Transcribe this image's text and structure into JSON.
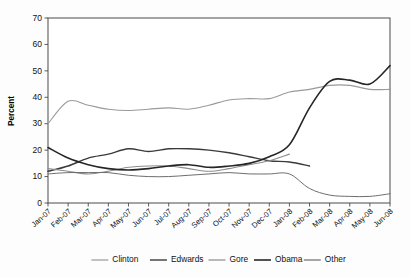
{
  "chart_data": {
    "type": "line",
    "title": "",
    "xlabel": "",
    "ylabel": "Percent",
    "ylim": [
      0,
      70
    ],
    "yticks": [
      0,
      10,
      20,
      30,
      40,
      50,
      60,
      70
    ],
    "grid": false,
    "legend_position": "bottom",
    "x": [
      "Jan-07",
      "Feb-07",
      "Mar-07",
      "Apr-07",
      "May-07",
      "Jun-07",
      "Jul-07",
      "Aug-07",
      "Sep-07",
      "Oct-07",
      "Nov-07",
      "Dec-07",
      "Jan-08",
      "Feb-08",
      "Mar-08",
      "Apr-08",
      "May-08",
      "Jun-08"
    ],
    "series": [
      {
        "name": "Clinton",
        "color": "#9a9a9a",
        "width": 1.1,
        "dash": "none",
        "values": [
          30,
          38.5,
          37,
          35.5,
          35,
          35.5,
          36,
          35.5,
          37,
          39,
          39.5,
          39.5,
          42,
          43,
          44.5,
          44.5,
          43,
          43
        ]
      },
      {
        "name": "Edwards",
        "color": "#3a3a3a",
        "width": 1.4,
        "dash": "none",
        "values": [
          12,
          14,
          17,
          18.5,
          20.5,
          19.5,
          20.5,
          20.5,
          20,
          19,
          17.5,
          16,
          15.5,
          14,
          null,
          null,
          null,
          null
        ]
      },
      {
        "name": "Gore",
        "color": "#8c8c8c",
        "width": 1.1,
        "dash": "none",
        "values": [
          13,
          12,
          11,
          12,
          13.5,
          14,
          14,
          13,
          12,
          13,
          14.5,
          16,
          18.5,
          null,
          null,
          null,
          null,
          null
        ]
      },
      {
        "name": "Obama",
        "color": "#262626",
        "width": 1.6,
        "dash": "none",
        "values": [
          21,
          17,
          14.5,
          13,
          12.5,
          13,
          14,
          14.5,
          13.5,
          14,
          15,
          17.5,
          22,
          36,
          46,
          46.5,
          45,
          52
        ]
      },
      {
        "name": "Other",
        "color": "#6d6d6d",
        "width": 1.0,
        "dash": "none",
        "values": [
          11,
          11.5,
          11.5,
          11.5,
          10.5,
          10,
          10,
          10.5,
          11,
          11.5,
          11,
          11,
          11,
          5.5,
          3,
          2.5,
          2.5,
          3.5
        ]
      }
    ]
  },
  "legend": {
    "items": [
      {
        "label": "Clinton"
      },
      {
        "label": "Edwards"
      },
      {
        "label": "Gore"
      },
      {
        "label": "Obama"
      },
      {
        "label": "Other"
      }
    ]
  }
}
